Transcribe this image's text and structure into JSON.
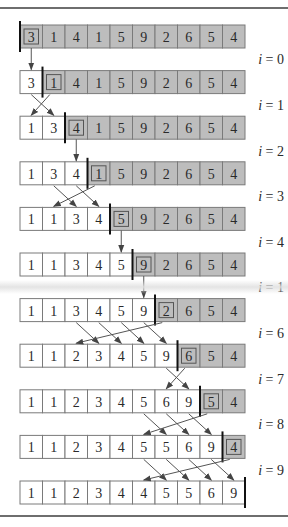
{
  "figure": {
    "colors": {
      "sorted_fill": "#ffffff",
      "unsorted_fill": "#bdbdbd",
      "cell_border": "#7a7a7a",
      "boundary_bar": "#111111",
      "arrow": "#555555",
      "rule": "#6e6e6e"
    },
    "rows": [
      {
        "values": [
          3,
          1,
          4,
          1,
          5,
          9,
          2,
          6,
          5,
          4
        ],
        "sorted_count": 0,
        "key_index": 0
      },
      {
        "values": [
          3,
          1,
          4,
          1,
          5,
          9,
          2,
          6,
          5,
          4
        ],
        "sorted_count": 1,
        "key_index": 1
      },
      {
        "values": [
          1,
          3,
          4,
          1,
          5,
          9,
          2,
          6,
          5,
          4
        ],
        "sorted_count": 2,
        "key_index": 2
      },
      {
        "values": [
          1,
          3,
          4,
          1,
          5,
          9,
          2,
          6,
          5,
          4
        ],
        "sorted_count": 3,
        "key_index": 3
      },
      {
        "values": [
          1,
          1,
          3,
          4,
          5,
          9,
          2,
          6,
          5,
          4
        ],
        "sorted_count": 4,
        "key_index": 4
      },
      {
        "values": [
          1,
          1,
          3,
          4,
          5,
          9,
          2,
          6,
          5,
          4
        ],
        "sorted_count": 5,
        "key_index": 5
      },
      {
        "values": [
          1,
          1,
          3,
          4,
          5,
          9,
          2,
          6,
          5,
          4
        ],
        "sorted_count": 6,
        "key_index": 6
      },
      {
        "values": [
          1,
          1,
          2,
          3,
          4,
          5,
          9,
          6,
          5,
          4
        ],
        "sorted_count": 7,
        "key_index": 7
      },
      {
        "values": [
          1,
          1,
          2,
          3,
          4,
          5,
          6,
          9,
          5,
          4
        ],
        "sorted_count": 8,
        "key_index": 8
      },
      {
        "values": [
          1,
          1,
          2,
          3,
          4,
          5,
          5,
          6,
          9,
          4
        ],
        "sorted_count": 9,
        "key_index": 9
      },
      {
        "values": [
          1,
          1,
          2,
          3,
          4,
          4,
          5,
          5,
          6,
          9
        ],
        "sorted_count": 10,
        "key_index": -1
      }
    ],
    "step_labels": [
      "i = 0",
      "i = 1",
      "i = 2",
      "i = 3",
      "i = 4",
      "i = 1",
      "i = 6",
      "i = 7",
      "i = 8",
      "i = 9"
    ],
    "transitions": [
      {
        "key_from": 0,
        "key_to": 0,
        "shifts": []
      },
      {
        "key_from": 1,
        "key_to": 0,
        "shifts": [
          0
        ]
      },
      {
        "key_from": 2,
        "key_to": 2,
        "shifts": []
      },
      {
        "key_from": 3,
        "key_to": 1,
        "shifts": [
          1,
          2
        ]
      },
      {
        "key_from": 4,
        "key_to": 4,
        "shifts": []
      },
      {
        "key_from": 5,
        "key_to": 5,
        "shifts": []
      },
      {
        "key_from": 6,
        "key_to": 2,
        "shifts": [
          2,
          3,
          4,
          5
        ]
      },
      {
        "key_from": 7,
        "key_to": 6,
        "shifts": [
          6
        ]
      },
      {
        "key_from": 8,
        "key_to": 5,
        "shifts": [
          5,
          6,
          7
        ]
      },
      {
        "key_from": 9,
        "key_to": 5,
        "shifts": [
          5,
          6,
          7,
          8
        ]
      }
    ]
  }
}
